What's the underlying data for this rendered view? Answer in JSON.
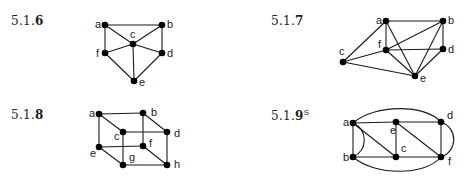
{
  "exercises": [
    {
      "id": "5.1.6",
      "prefix": "5.1.",
      "number": "6",
      "superscript": "",
      "label_pos": [
        11,
        21
      ],
      "nodes": [
        {
          "name": "a",
          "x": 105,
          "y": 25,
          "lx": -10,
          "ly": 3
        },
        {
          "name": "b",
          "x": 162,
          "y": 25,
          "lx": 5,
          "ly": 3
        },
        {
          "name": "c",
          "x": 133,
          "y": 44,
          "lx": -3,
          "ly": -6
        },
        {
          "name": "f",
          "x": 105,
          "y": 53,
          "lx": -9,
          "ly": 4
        },
        {
          "name": "d",
          "x": 162,
          "y": 53,
          "lx": 5,
          "ly": 4
        },
        {
          "name": "e",
          "x": 134,
          "y": 81,
          "lx": 5,
          "ly": 5
        }
      ],
      "edges": [
        [
          "a",
          "b"
        ],
        [
          "a",
          "f"
        ],
        [
          "a",
          "c"
        ],
        [
          "b",
          "c"
        ],
        [
          "b",
          "d"
        ],
        [
          "c",
          "f"
        ],
        [
          "c",
          "d"
        ],
        [
          "c",
          "e"
        ],
        [
          "f",
          "e"
        ],
        [
          "d",
          "e"
        ]
      ],
      "curves": []
    },
    {
      "id": "5.1.7",
      "prefix": "5.1.",
      "number": "7",
      "superscript": "",
      "label_pos": [
        271,
        21
      ],
      "nodes": [
        {
          "name": "a",
          "x": 386,
          "y": 21,
          "lx": -10,
          "ly": 3
        },
        {
          "name": "b",
          "x": 443,
          "y": 21,
          "lx": 5,
          "ly": 3
        },
        {
          "name": "f",
          "x": 386,
          "y": 50,
          "lx": -8,
          "ly": -2
        },
        {
          "name": "d",
          "x": 443,
          "y": 49,
          "lx": 5,
          "ly": 4
        },
        {
          "name": "c",
          "x": 343,
          "y": 62,
          "lx": -4,
          "ly": -7
        },
        {
          "name": "e",
          "x": 415,
          "y": 76,
          "lx": 5,
          "ly": 6
        }
      ],
      "edges": [
        [
          "a",
          "b"
        ],
        [
          "a",
          "f"
        ],
        [
          "a",
          "c"
        ],
        [
          "a",
          "e"
        ],
        [
          "b",
          "f"
        ],
        [
          "b",
          "d"
        ],
        [
          "b",
          "e"
        ],
        [
          "f",
          "d"
        ],
        [
          "f",
          "c"
        ],
        [
          "f",
          "e"
        ],
        [
          "d",
          "e"
        ],
        [
          "c",
          "e"
        ]
      ],
      "curves": []
    },
    {
      "id": "5.1.8",
      "prefix": "5.1.",
      "number": "8",
      "superscript": "",
      "label_pos": [
        11,
        115
      ],
      "nodes": [
        {
          "name": "a",
          "x": 99,
          "y": 114,
          "lx": -10,
          "ly": 3
        },
        {
          "name": "b",
          "x": 143,
          "y": 113,
          "lx": 8,
          "ly": 3
        },
        {
          "name": "c",
          "x": 123,
          "y": 132,
          "lx": -9,
          "ly": 8
        },
        {
          "name": "d",
          "x": 167,
          "y": 132,
          "lx": 7,
          "ly": 5
        },
        {
          "name": "e",
          "x": 99,
          "y": 147,
          "lx": -9,
          "ly": 10
        },
        {
          "name": "f",
          "x": 143,
          "y": 146,
          "lx": 6,
          "ly": 1
        },
        {
          "name": "g",
          "x": 123,
          "y": 165,
          "lx": 6,
          "ly": -4
        },
        {
          "name": "h",
          "x": 167,
          "y": 165,
          "lx": 7,
          "ly": 3
        }
      ],
      "edges": [
        [
          "a",
          "b"
        ],
        [
          "a",
          "c"
        ],
        [
          "a",
          "e"
        ],
        [
          "b",
          "d"
        ],
        [
          "b",
          "f"
        ],
        [
          "c",
          "d"
        ],
        [
          "c",
          "g"
        ],
        [
          "d",
          "h"
        ],
        [
          "e",
          "f"
        ],
        [
          "e",
          "g"
        ],
        [
          "f",
          "h"
        ],
        [
          "g",
          "h"
        ]
      ],
      "curves": []
    },
    {
      "id": "5.1.9S",
      "prefix": "5.1.",
      "number": "9",
      "superscript": "S",
      "label_pos": [
        271,
        115
      ],
      "nodes": [
        {
          "name": "a",
          "x": 353,
          "y": 123,
          "lx": -10,
          "ly": 3
        },
        {
          "name": "e",
          "x": 396,
          "y": 122,
          "lx": -6,
          "ly": 12
        },
        {
          "name": "d",
          "x": 441,
          "y": 122,
          "lx": 6,
          "ly": -3
        },
        {
          "name": "b",
          "x": 353,
          "y": 157,
          "lx": -10,
          "ly": 4
        },
        {
          "name": "c",
          "x": 396,
          "y": 157,
          "lx": 5,
          "ly": -5
        },
        {
          "name": "f",
          "x": 441,
          "y": 157,
          "lx": 7,
          "ly": 8
        }
      ],
      "edges": [
        [
          "a",
          "e"
        ],
        [
          "e",
          "d"
        ],
        [
          "a",
          "b"
        ],
        [
          "a",
          "c"
        ],
        [
          "e",
          "c"
        ],
        [
          "e",
          "f"
        ],
        [
          "d",
          "f"
        ],
        [
          "b",
          "c"
        ],
        [
          "c",
          "f"
        ]
      ],
      "curves": [
        {
          "from": "a",
          "to": "d",
          "path": "M353,123 C375,104 425,104 441,122"
        },
        {
          "from": "b",
          "to": "f",
          "path": "M353,157 C375,176 425,176 441,157"
        },
        {
          "from": "a",
          "to": "b",
          "path": "M353,123 C368,130 368,150 353,157"
        },
        {
          "from": "d",
          "to": "f",
          "path": "M441,122 C458,128 458,151 441,157"
        }
      ]
    }
  ]
}
